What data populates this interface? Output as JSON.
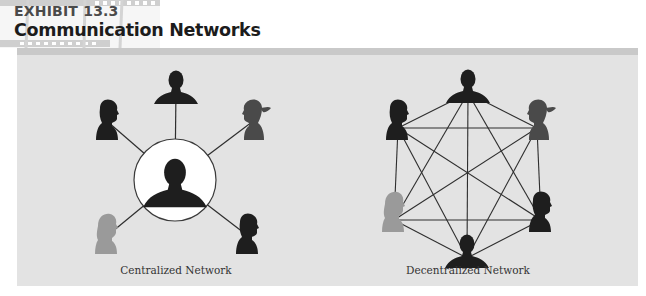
{
  "header": {
    "exhibit_number": "EXHIBIT 13.3",
    "title": "Communication Networks"
  },
  "colors": {
    "panel_background": "#e3e3e3",
    "rule": "#c9c9c9",
    "edge": "#2e2e2e",
    "silhouette_dark": "#1e1e1e",
    "silhouette_medium": "#4a4a4a",
    "silhouette_light": "#9a9a9a",
    "hub_circle_fill": "#ffffff"
  },
  "diagrams": [
    {
      "id": "centralized",
      "caption": "Centralized Network",
      "hub": {
        "x": 175,
        "y": 180,
        "radius": 41,
        "silhouette": "person-male-front"
      },
      "nodes": [
        {
          "id": "top",
          "x": 176,
          "y": 88,
          "silhouette": "person-front",
          "shade": "dark"
        },
        {
          "id": "upper-left",
          "x": 108,
          "y": 122,
          "silhouette": "person-profile-male",
          "shade": "dark"
        },
        {
          "id": "upper-right",
          "x": 252,
          "y": 122,
          "silhouette": "person-profile-ponytail",
          "shade": "medium"
        },
        {
          "id": "lower-left",
          "x": 107,
          "y": 236,
          "silhouette": "person-profile-female",
          "shade": "light"
        },
        {
          "id": "lower-right",
          "x": 248,
          "y": 236,
          "silhouette": "person-profile-male",
          "shade": "dark"
        }
      ],
      "edges": [
        [
          "hub",
          "top"
        ],
        [
          "hub",
          "upper-left"
        ],
        [
          "hub",
          "upper-right"
        ],
        [
          "hub",
          "lower-left"
        ],
        [
          "hub",
          "lower-right"
        ]
      ]
    },
    {
      "id": "decentralized",
      "caption": "Decentralized Network",
      "nodes": [
        {
          "id": "top",
          "x": 468,
          "y": 87,
          "silhouette": "person-front",
          "shade": "dark"
        },
        {
          "id": "upper-left",
          "x": 398,
          "y": 122,
          "silhouette": "person-profile-male",
          "shade": "dark"
        },
        {
          "id": "upper-right",
          "x": 537,
          "y": 122,
          "silhouette": "person-profile-ponytail",
          "shade": "medium"
        },
        {
          "id": "mid-left",
          "x": 394,
          "y": 214,
          "silhouette": "person-profile-female",
          "shade": "light"
        },
        {
          "id": "mid-right",
          "x": 541,
          "y": 214,
          "silhouette": "person-profile-male",
          "shade": "dark"
        },
        {
          "id": "bottom",
          "x": 467,
          "y": 252,
          "silhouette": "person-front",
          "shade": "dark"
        }
      ],
      "edges": "all-pairs"
    }
  ]
}
